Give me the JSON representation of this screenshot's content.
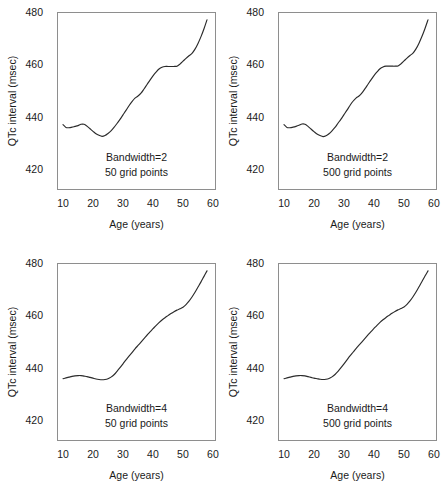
{
  "figure": {
    "background": "#ffffff",
    "curve_color": "#2b2b2b",
    "axis_color": "#8e8e8e"
  },
  "axes": {
    "xlabel": "Age (years)",
    "ylabel": "QTc interval (msec)",
    "xticks": [
      "10",
      "20",
      "30",
      "40",
      "50",
      "60"
    ],
    "yticks": [
      "480",
      "460",
      "440",
      "420"
    ]
  },
  "panels": [
    {
      "id": "top-left",
      "annotation_line1": "Bandwidth=2",
      "annotation_line2": "50 grid points"
    },
    {
      "id": "top-right",
      "annotation_line1": "Bandwidth=2",
      "annotation_line2": "500 grid points"
    },
    {
      "id": "bottom-left",
      "annotation_line1": "Bandwidth=4",
      "annotation_line2": "50 grid points"
    },
    {
      "id": "bottom-right",
      "annotation_line1": "Bandwidth=4",
      "annotation_line2": "500 grid points"
    }
  ],
  "chart_data": [
    {
      "type": "line",
      "title": "Bandwidth=2, 50 grid points",
      "xlabel": "Age (years)",
      "ylabel": "QTc interval (msec)",
      "xlim": [
        8,
        61
      ],
      "ylim": [
        415,
        483
      ],
      "xticks": [
        10,
        20,
        30,
        40,
        50,
        60
      ],
      "yticks": [
        420,
        440,
        460,
        480
      ],
      "grid": false,
      "legend": null,
      "annotations": [
        "Bandwidth=2",
        "50 grid points"
      ],
      "series": [
        {
          "name": "Kernel smooth (bw=2, 50 pts)",
          "x": [
            10.0,
            11.0,
            12.0,
            13.0,
            14.0,
            15.0,
            16.0,
            17.0,
            18.0,
            19.0,
            20.0,
            21.0,
            22.0,
            23.0,
            24.0,
            25.0,
            26.0,
            27.0,
            28.0,
            29.0,
            30.0,
            31.0,
            32.0,
            33.0,
            34.0,
            35.0,
            36.0,
            37.0,
            38.0,
            39.0,
            40.0,
            41.0,
            42.0,
            43.0,
            44.0,
            45.0,
            46.0,
            47.0,
            48.0,
            49.0,
            50.0,
            51.0,
            52.0,
            53.0,
            54.0,
            55.0,
            56.0,
            57.0,
            58.0
          ],
          "y": [
            440.0,
            438.9,
            438.8,
            439.0,
            439.3,
            439.6,
            440.1,
            440.1,
            439.4,
            438.4,
            437.4,
            436.5,
            435.9,
            435.5,
            435.8,
            436.6,
            437.6,
            438.9,
            440.4,
            442.0,
            443.7,
            445.4,
            447.2,
            448.8,
            450.1,
            450.9,
            452.0,
            453.6,
            455.3,
            457.0,
            458.6,
            460.0,
            461.2,
            461.9,
            462.2,
            462.2,
            462.2,
            462.2,
            462.3,
            463.1,
            464.2,
            465.3,
            466.3,
            467.2,
            468.8,
            471.0,
            473.6,
            476.6,
            480.0
          ]
        }
      ]
    },
    {
      "type": "line",
      "title": "Bandwidth=2, 500 grid points",
      "xlabel": "Age (years)",
      "ylabel": "QTc interval (msec)",
      "xlim": [
        8,
        61
      ],
      "ylim": [
        415,
        483
      ],
      "xticks": [
        10,
        20,
        30,
        40,
        50,
        60
      ],
      "yticks": [
        420,
        440,
        460,
        480
      ],
      "grid": false,
      "legend": null,
      "annotations": [
        "Bandwidth=2",
        "500 grid points"
      ],
      "series": [
        {
          "name": "Kernel smooth (bw=2, 500 pts)",
          "x": [
            10.0,
            11.0,
            12.0,
            13.0,
            14.0,
            15.0,
            16.0,
            17.0,
            18.0,
            19.0,
            20.0,
            21.0,
            22.0,
            23.0,
            24.0,
            25.0,
            26.0,
            27.0,
            28.0,
            29.0,
            30.0,
            31.0,
            32.0,
            33.0,
            34.0,
            35.0,
            36.0,
            37.0,
            38.0,
            39.0,
            40.0,
            41.0,
            42.0,
            43.0,
            44.0,
            45.0,
            46.0,
            47.0,
            48.0,
            49.0,
            50.0,
            51.0,
            52.0,
            53.0,
            54.0,
            55.0,
            56.0,
            57.0,
            58.0
          ],
          "y": [
            440.0,
            438.9,
            438.8,
            439.0,
            439.3,
            439.7,
            440.2,
            440.1,
            439.3,
            438.3,
            437.3,
            436.4,
            435.8,
            435.4,
            435.7,
            436.5,
            437.6,
            438.9,
            440.5,
            442.1,
            443.8,
            445.5,
            447.3,
            448.9,
            450.1,
            450.9,
            452.1,
            453.7,
            455.4,
            457.1,
            458.7,
            460.1,
            461.3,
            462.0,
            462.3,
            462.3,
            462.3,
            462.3,
            462.4,
            463.2,
            464.3,
            465.4,
            466.4,
            467.3,
            468.9,
            471.1,
            473.7,
            476.7,
            480.0
          ]
        }
      ]
    },
    {
      "type": "line",
      "title": "Bandwidth=4, 50 grid points",
      "xlabel": "Age (years)",
      "ylabel": "QTc interval (msec)",
      "xlim": [
        8,
        61
      ],
      "ylim": [
        415,
        483
      ],
      "xticks": [
        10,
        20,
        30,
        40,
        50,
        60
      ],
      "yticks": [
        420,
        440,
        460,
        480
      ],
      "grid": false,
      "legend": null,
      "annotations": [
        "Bandwidth=4",
        "50 grid points"
      ],
      "series": [
        {
          "name": "Kernel smooth (bw=4, 50 pts)",
          "x": [
            10.0,
            11.0,
            12.0,
            13.0,
            14.0,
            15.0,
            16.0,
            17.0,
            18.0,
            19.0,
            20.0,
            21.0,
            22.0,
            23.0,
            24.0,
            25.0,
            26.0,
            27.0,
            28.0,
            29.0,
            30.0,
            31.0,
            32.0,
            33.0,
            34.0,
            35.0,
            36.0,
            37.0,
            38.0,
            39.0,
            40.0,
            41.0,
            42.0,
            43.0,
            44.0,
            45.0,
            46.0,
            47.0,
            48.0,
            49.0,
            50.0,
            51.0,
            52.0,
            53.0,
            54.0,
            55.0,
            56.0,
            57.0,
            58.0
          ],
          "y": [
            438.8,
            439.1,
            439.4,
            439.7,
            439.9,
            440.0,
            440.0,
            439.8,
            439.6,
            439.3,
            439.0,
            438.7,
            438.5,
            438.4,
            438.5,
            438.8,
            439.4,
            440.3,
            441.6,
            443.0,
            444.5,
            446.0,
            447.4,
            448.8,
            450.2,
            451.5,
            452.8,
            454.1,
            455.4,
            456.7,
            457.9,
            459.1,
            460.2,
            461.2,
            462.1,
            462.9,
            463.7,
            464.4,
            465.0,
            465.5,
            466.1,
            467.1,
            468.4,
            470.0,
            471.8,
            473.8,
            475.8,
            477.9,
            480.0
          ]
        }
      ]
    },
    {
      "type": "line",
      "title": "Bandwidth=4, 500 grid points",
      "xlabel": "Age (years)",
      "ylabel": "QTc interval (msec)",
      "xlim": [
        8,
        61
      ],
      "ylim": [
        415,
        483
      ],
      "xticks": [
        10,
        20,
        30,
        40,
        50,
        60
      ],
      "yticks": [
        420,
        440,
        460,
        480
      ],
      "grid": false,
      "legend": null,
      "annotations": [
        "Bandwidth=4",
        "500 grid points"
      ],
      "series": [
        {
          "name": "Kernel smooth (bw=4, 500 pts)",
          "x": [
            10.0,
            11.0,
            12.0,
            13.0,
            14.0,
            15.0,
            16.0,
            17.0,
            18.0,
            19.0,
            20.0,
            21.0,
            22.0,
            23.0,
            24.0,
            25.0,
            26.0,
            27.0,
            28.0,
            29.0,
            30.0,
            31.0,
            32.0,
            33.0,
            34.0,
            35.0,
            36.0,
            37.0,
            38.0,
            39.0,
            40.0,
            41.0,
            42.0,
            43.0,
            44.0,
            45.0,
            46.0,
            47.0,
            48.0,
            49.0,
            50.0,
            51.0,
            52.0,
            53.0,
            54.0,
            55.0,
            56.0,
            57.0,
            58.0
          ],
          "y": [
            438.8,
            439.1,
            439.4,
            439.7,
            439.9,
            440.0,
            440.0,
            439.9,
            439.6,
            439.3,
            439.0,
            438.8,
            438.6,
            438.5,
            438.6,
            438.9,
            439.5,
            440.4,
            441.6,
            443.0,
            444.5,
            446.0,
            447.5,
            448.9,
            450.3,
            451.6,
            452.9,
            454.2,
            455.5,
            456.8,
            458.0,
            459.2,
            460.3,
            461.3,
            462.2,
            463.0,
            463.8,
            464.5,
            465.1,
            465.6,
            466.2,
            467.2,
            468.5,
            470.1,
            471.9,
            473.9,
            475.9,
            478.0,
            480.0
          ]
        }
      ]
    }
  ]
}
